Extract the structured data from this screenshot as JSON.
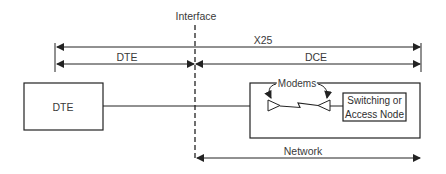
{
  "diagram": {
    "type": "network-interface-diagram",
    "labels": {
      "interface": "Interface",
      "x25": "X25",
      "dte_span": "DTE",
      "dce_span": "DCE",
      "network": "Network",
      "modems": "Modems"
    },
    "nodes": [
      {
        "id": "dte",
        "label": "DTE"
      },
      {
        "id": "network-cloud",
        "label": ""
      },
      {
        "id": "switching-node",
        "label_line1": "Switching or",
        "label_line2": "Access Node"
      }
    ],
    "edges": [
      {
        "from": "dte",
        "to": "network-cloud",
        "kind": "line"
      },
      {
        "from": "modem-left",
        "to": "modem-right",
        "kind": "lightning-link"
      },
      {
        "from": "modem-right",
        "to": "switching-node",
        "kind": "line"
      }
    ],
    "spans": [
      {
        "label": "X25",
        "from": "left-boundary",
        "to": "right-boundary"
      },
      {
        "label": "DTE",
        "from": "left-boundary",
        "to": "interface"
      },
      {
        "label": "DCE",
        "from": "interface",
        "to": "right-boundary"
      },
      {
        "label": "Network",
        "from": "interface",
        "to": "right-boundary"
      }
    ],
    "colors": {
      "line": "#2a2a2a",
      "background": "#ffffff"
    }
  }
}
